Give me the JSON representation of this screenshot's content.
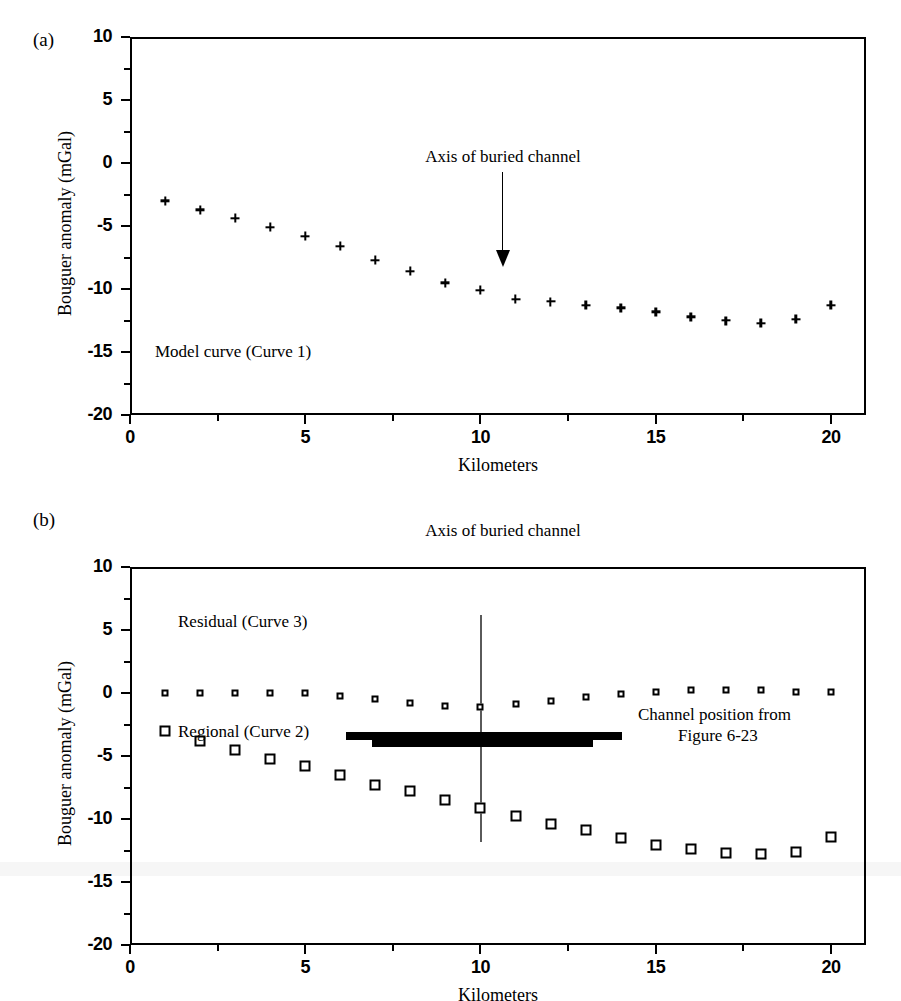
{
  "figure": {
    "panels": [
      {
        "label": "(a)"
      },
      {
        "label": "(b)"
      }
    ]
  },
  "chart_data": [
    {
      "type": "scatter",
      "panel": "(a)",
      "title": "",
      "xlabel": "Kilometers",
      "ylabel": "Bouguer anomaly (mGal)",
      "xlim": [
        0,
        21
      ],
      "ylim": [
        -20,
        10
      ],
      "xticks": [
        0,
        5,
        10,
        15,
        20
      ],
      "xticklabels": [
        "0",
        "5",
        "10",
        "15",
        "20"
      ],
      "yticks": [
        10,
        5,
        0,
        -5,
        -10,
        -15,
        -20
      ],
      "yticklabels": [
        "10",
        "5",
        "0",
        "-5",
        "-10",
        "-15",
        "-20"
      ],
      "minor_tick_step_x": 2.5,
      "minor_tick_step_y": 2.5,
      "grid": false,
      "legend": "none",
      "series": [
        {
          "name": "Model curve (Curve 1)",
          "marker": "plus",
          "x": [
            1,
            2,
            3,
            4,
            5,
            6,
            7,
            8,
            9,
            10,
            11,
            12,
            13,
            14,
            15,
            16,
            17,
            18,
            19,
            20
          ],
          "y": [
            -3.0,
            -3.7,
            -4.4,
            -5.1,
            -5.8,
            -6.6,
            -7.7,
            -8.6,
            -9.5,
            -10.1,
            -10.8,
            -11.0,
            -11.3,
            -11.5,
            -11.8,
            -12.2,
            -12.5,
            -12.7,
            -12.4,
            -11.3
          ]
        }
      ],
      "annotations": [
        {
          "name": "axis-of-buried-channel",
          "text": "Axis of buried channel",
          "x": 10,
          "y": 1.3,
          "arrow_to_y": -8.5
        },
        {
          "name": "series-label-model-curve",
          "text": "Model curve (Curve 1)",
          "x": 1.3,
          "y": -14.8
        }
      ]
    },
    {
      "type": "scatter",
      "panel": "(b)",
      "title": "",
      "xlabel": "Kilometers",
      "ylabel": "Bouguer anomaly (mGal)",
      "xlim": [
        0,
        21
      ],
      "ylim": [
        -20,
        10
      ],
      "xticks": [
        0,
        5,
        10,
        15,
        20
      ],
      "xticklabels": [
        "0",
        "5",
        "10",
        "15",
        "20"
      ],
      "yticks": [
        10,
        5,
        0,
        -5,
        -10,
        -15,
        -20
      ],
      "yticklabels": [
        "10",
        "5",
        "0",
        "-5",
        "-10",
        "-15",
        "-20"
      ],
      "minor_tick_step_x": 2.5,
      "minor_tick_step_y": 2.5,
      "grid": false,
      "legend": "none",
      "series": [
        {
          "name": "Residual (Curve 3)",
          "marker": "small-open-square",
          "x": [
            1,
            2,
            3,
            4,
            5,
            6,
            7,
            8,
            9,
            10,
            11,
            12,
            13,
            14,
            15,
            16,
            17,
            18,
            19,
            20
          ],
          "y": [
            0.0,
            0.0,
            0.0,
            0.0,
            0.0,
            -0.2,
            -0.5,
            -0.8,
            -1.0,
            -1.1,
            -0.9,
            -0.6,
            -0.3,
            -0.1,
            0.1,
            0.2,
            0.2,
            0.2,
            0.1,
            0.1
          ]
        },
        {
          "name": "Regional (Curve 2)",
          "marker": "open-square",
          "x": [
            1,
            2,
            3,
            4,
            5,
            6,
            7,
            8,
            9,
            10,
            11,
            12,
            13,
            14,
            15,
            16,
            17,
            18,
            19,
            20
          ],
          "y": [
            -3.0,
            -3.8,
            -4.5,
            -5.2,
            -5.8,
            -6.5,
            -7.3,
            -7.8,
            -8.5,
            -9.1,
            -9.8,
            -10.4,
            -10.9,
            -11.5,
            -12.1,
            -12.4,
            -12.7,
            -12.8,
            -12.6,
            -11.4
          ]
        }
      ],
      "annotations": [
        {
          "name": "axis-of-buried-channel",
          "text": "Axis of buried channel",
          "x": 10,
          "y": 7.6,
          "line_from_y": 6.2,
          "line_to_y": -11.8
        },
        {
          "name": "series-label-residual",
          "text": "Residual (Curve 3)",
          "x": 1.4,
          "y": 2.1
        },
        {
          "name": "series-label-regional",
          "text": "Regional (Curve 2)",
          "x": 1.4,
          "y": -6.6
        },
        {
          "name": "channel-position-label-line1",
          "text": "Channel position from",
          "x": 14.7,
          "y": -4.9
        },
        {
          "name": "channel-position-label-line2",
          "text": "Figure 6-23",
          "x": 16.6,
          "y": -6.2
        }
      ],
      "channel_bar": {
        "name": "channel-position-bar",
        "upper": {
          "x_start": 6.15,
          "x_end": 14.05,
          "y": -3.4
        },
        "lower": {
          "x_start": 6.9,
          "x_end": 13.2,
          "y": -3.8
        }
      }
    }
  ]
}
